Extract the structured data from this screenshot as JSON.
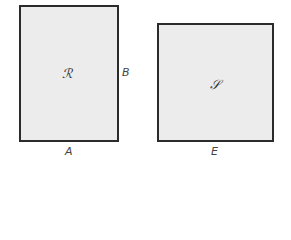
{
  "diagram": {
    "shapes": [
      {
        "id": "R",
        "type": "rectangle",
        "label": "ℛ",
        "width_label": "A",
        "height_label": "B"
      },
      {
        "id": "S",
        "type": "square",
        "label": "𝒮",
        "side_label": "E"
      }
    ],
    "colors": {
      "fill": "#ececec",
      "stroke": "#2b2b2b",
      "text": "#444444"
    }
  }
}
